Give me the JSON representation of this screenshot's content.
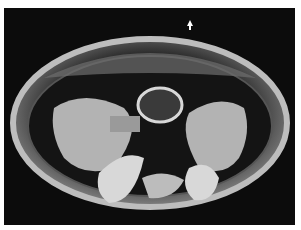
{
  "image": {
    "subject": "scanning electron micrograph of oval specimen, ventral view",
    "background_color": "#0c0c0c",
    "border_color": "#ffffff",
    "marker": "small white arrow near top center"
  }
}
